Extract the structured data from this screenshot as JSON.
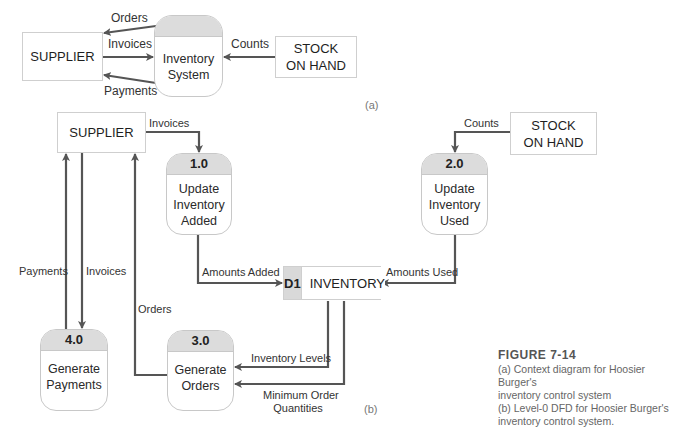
{
  "context_diagram": {
    "subfigure_label": "(a)",
    "external_entities": {
      "supplier": "SUPPLIER",
      "stock_on_hand_line1": "STOCK",
      "stock_on_hand_line2": "ON HAND"
    },
    "process": {
      "line1": "Inventory",
      "line2": "System"
    },
    "flows": {
      "orders": "Orders",
      "invoices": "Invoices",
      "payments": "Payments",
      "counts": "Counts"
    }
  },
  "level0_dfd": {
    "subfigure_label": "(b)",
    "external_entities": {
      "supplier": "SUPPLIER",
      "stock_on_hand_line1": "STOCK",
      "stock_on_hand_line2": "ON HAND"
    },
    "processes": [
      {
        "id": "1.0",
        "line1": "Update",
        "line2": "Inventory",
        "line3": "Added"
      },
      {
        "id": "2.0",
        "line1": "Update",
        "line2": "Inventory",
        "line3": "Used"
      },
      {
        "id": "3.0",
        "line1": "Generate",
        "line2": "Orders"
      },
      {
        "id": "4.0",
        "line1": "Generate",
        "line2": "Payments"
      }
    ],
    "data_store": {
      "id": "D1",
      "name": "INVENTORY"
    },
    "flows": {
      "invoices_to_1": "Invoices",
      "counts_to_2": "Counts",
      "amounts_added": "Amounts Added",
      "amounts_used": "Amounts Used",
      "payments": "Payments",
      "invoices_to_4": "Invoices",
      "orders": "Orders",
      "inventory_levels": "Inventory Levels",
      "min_order_line1": "Minimum Order",
      "min_order_line2": "Quantities"
    }
  },
  "caption": {
    "figure": "FIGURE 7-14",
    "line_a1": "(a) Context diagram for Hoosier Burger's",
    "line_a2": "inventory control system",
    "line_b1": "(b) Level-0 DFD for Hoosier Burger's",
    "line_b2": "inventory control system."
  },
  "colors": {
    "arrow": "#555555",
    "process_header": "#dcdcdc",
    "border": "#c8c8c8",
    "caption_text": "#666666"
  }
}
